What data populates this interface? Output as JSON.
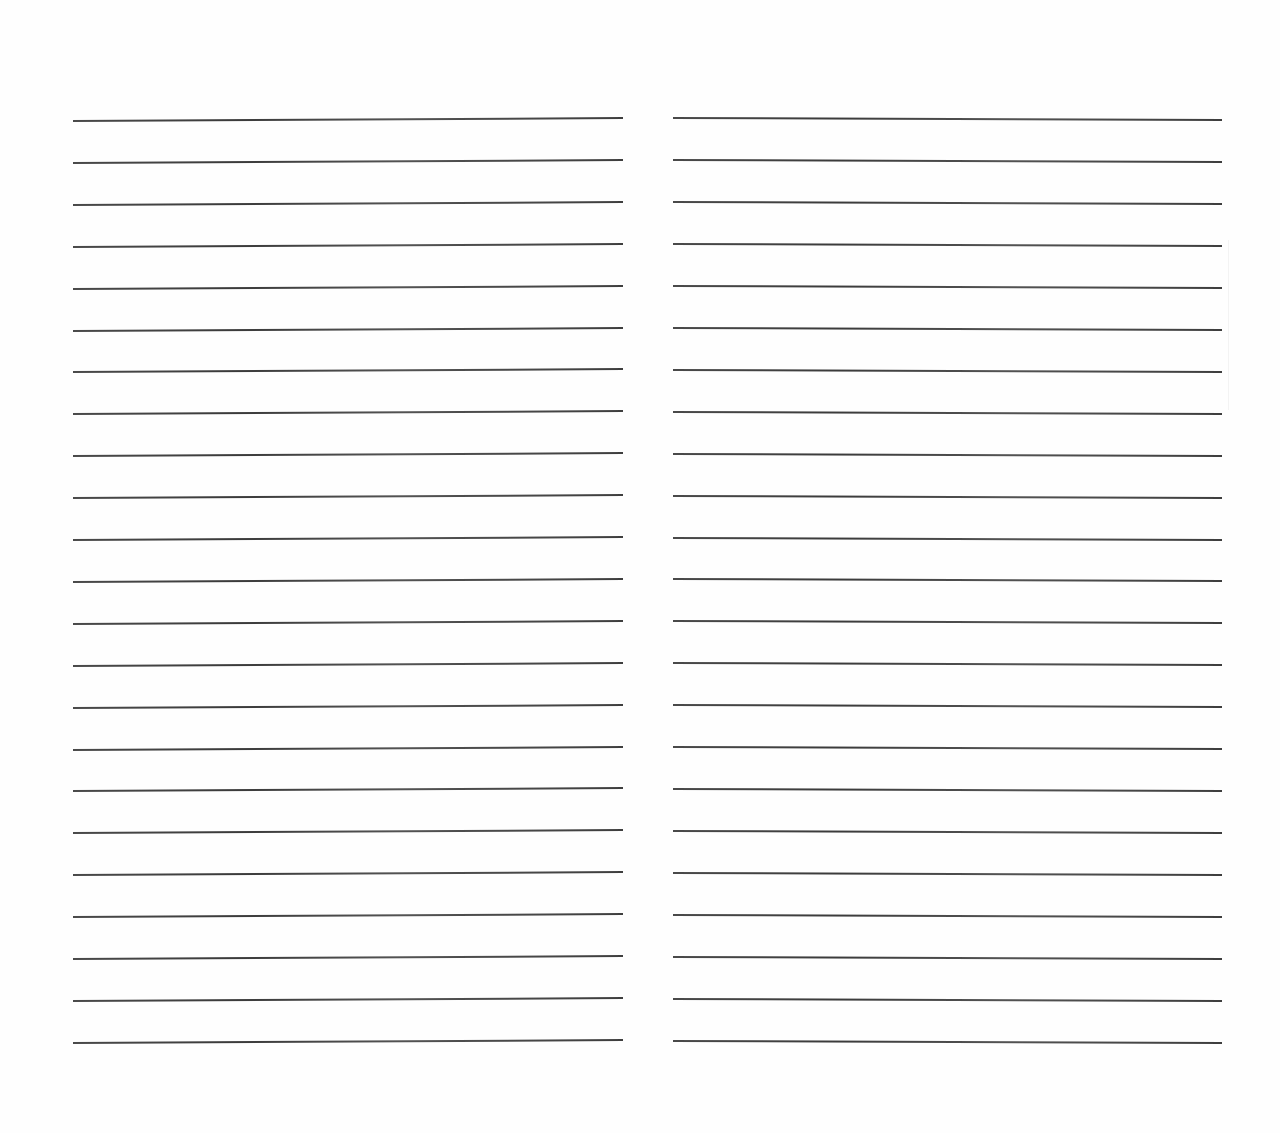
{
  "document": {
    "type": "lined-paper",
    "background_color": "#ffffff",
    "line_color": "#333333",
    "columns": [
      {
        "name": "left-column",
        "x": 73,
        "width": 550,
        "first_line_y": 120,
        "line_count": 23,
        "line_spacing": 41.9,
        "tilt": 1.5
      },
      {
        "name": "right-column",
        "x": 673,
        "width": 549,
        "first_line_y": 117,
        "line_count": 23,
        "line_spacing": 41.95,
        "tilt": -1.0
      }
    ]
  }
}
